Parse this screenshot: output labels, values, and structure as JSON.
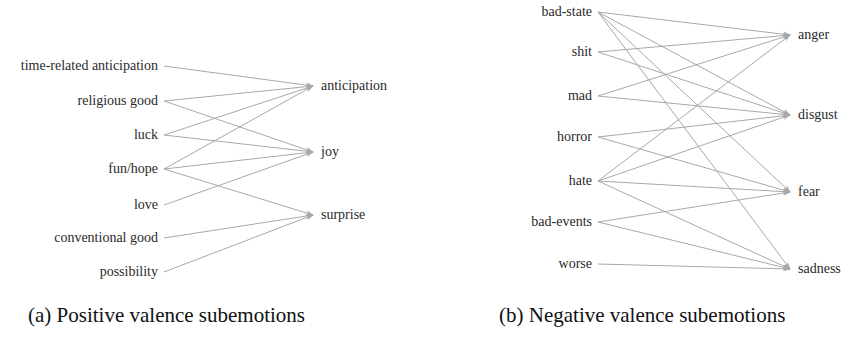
{
  "figure": {
    "colors": {
      "edge": "#a8a8a8",
      "text": "#2a2a2a",
      "background": "#ffffff"
    },
    "panels": [
      {
        "id": "a",
        "caption": "(a) Positive valence subemotions",
        "caption_pos": {
          "x": 28,
          "y": 303
        },
        "layout": {
          "left_text_x": 158,
          "left_line_x": 164,
          "right_text_x": 321,
          "right_tip_x": 313
        },
        "left_nodes": [
          {
            "label": "time-related anticipation",
            "y": 66
          },
          {
            "label": "religious good",
            "y": 101
          },
          {
            "label": "luck",
            "y": 135
          },
          {
            "label": "fun/hope",
            "y": 169
          },
          {
            "label": "love",
            "y": 205
          },
          {
            "label": "conventional good",
            "y": 238
          },
          {
            "label": "possibility",
            "y": 272
          }
        ],
        "right_nodes": [
          {
            "label": "anticipation",
            "y": 86
          },
          {
            "label": "joy",
            "y": 152
          },
          {
            "label": "surprise",
            "y": 215
          }
        ],
        "edges": [
          [
            "time-related anticipation",
            "anticipation"
          ],
          [
            "religious good",
            "anticipation"
          ],
          [
            "religious good",
            "joy"
          ],
          [
            "luck",
            "anticipation"
          ],
          [
            "luck",
            "joy"
          ],
          [
            "fun/hope",
            "anticipation"
          ],
          [
            "fun/hope",
            "joy"
          ],
          [
            "fun/hope",
            "surprise"
          ],
          [
            "love",
            "joy"
          ],
          [
            "conventional good",
            "surprise"
          ],
          [
            "possibility",
            "surprise"
          ]
        ]
      },
      {
        "id": "b",
        "caption": "(b) Negative valence subemotions",
        "caption_pos": {
          "x": 499,
          "y": 303
        },
        "layout": {
          "left_text_x": 592,
          "left_line_x": 598,
          "right_text_x": 798,
          "right_tip_x": 790
        },
        "left_nodes": [
          {
            "label": "bad-state",
            "y": 12
          },
          {
            "label": "shit",
            "y": 52
          },
          {
            "label": "mad",
            "y": 96
          },
          {
            "label": "horror",
            "y": 137
          },
          {
            "label": "hate",
            "y": 181
          },
          {
            "label": "bad-events",
            "y": 222
          },
          {
            "label": "worse",
            "y": 264
          }
        ],
        "right_nodes": [
          {
            "label": "anger",
            "y": 35
          },
          {
            "label": "disgust",
            "y": 115
          },
          {
            "label": "fear",
            "y": 192
          },
          {
            "label": "sadness",
            "y": 269
          }
        ],
        "edges": [
          [
            "bad-state",
            "anger"
          ],
          [
            "bad-state",
            "disgust"
          ],
          [
            "bad-state",
            "fear"
          ],
          [
            "bad-state",
            "sadness"
          ],
          [
            "shit",
            "anger"
          ],
          [
            "shit",
            "disgust"
          ],
          [
            "mad",
            "anger"
          ],
          [
            "mad",
            "disgust"
          ],
          [
            "horror",
            "disgust"
          ],
          [
            "horror",
            "fear"
          ],
          [
            "hate",
            "anger"
          ],
          [
            "hate",
            "disgust"
          ],
          [
            "hate",
            "fear"
          ],
          [
            "hate",
            "sadness"
          ],
          [
            "bad-events",
            "fear"
          ],
          [
            "bad-events",
            "sadness"
          ],
          [
            "worse",
            "sadness"
          ]
        ]
      }
    ]
  }
}
